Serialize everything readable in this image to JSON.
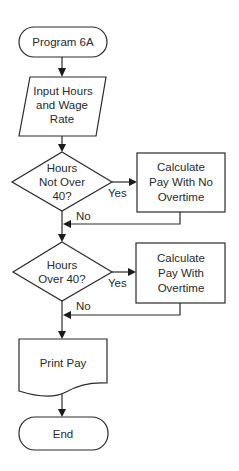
{
  "flowchart": {
    "title": "Program 6A",
    "nodes": {
      "start": {
        "type": "terminal",
        "lines": [
          "Program 6A"
        ]
      },
      "input": {
        "type": "input-output",
        "lines": [
          "Input Hours",
          "and Wage",
          "Rate"
        ]
      },
      "decision1": {
        "type": "decision",
        "lines": [
          "Hours",
          "Not Over",
          "40?"
        ],
        "yes_label": "Yes",
        "no_label": "No"
      },
      "process1": {
        "type": "process",
        "lines": [
          "Calculate",
          "Pay With No",
          "Overtime"
        ]
      },
      "decision2": {
        "type": "decision",
        "lines": [
          "Hours",
          "Over 40?"
        ],
        "yes_label": "Yes",
        "no_label": "No"
      },
      "process2": {
        "type": "process",
        "lines": [
          "Calculate",
          "Pay With",
          "Overtime"
        ]
      },
      "output": {
        "type": "document",
        "lines": [
          "Print Pay"
        ]
      },
      "end": {
        "type": "terminal",
        "lines": [
          "End"
        ]
      }
    },
    "colors": {
      "stroke": "#2a2a2a",
      "fill": "#ffffff",
      "text": "#2a2a2a"
    }
  }
}
